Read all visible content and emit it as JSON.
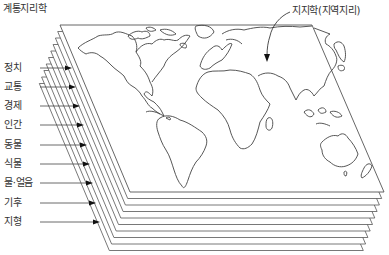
{
  "diagram": {
    "title": "계통지리학",
    "top_label": "지지학(지역지리)",
    "colors": {
      "line": "#555555",
      "text": "#333333",
      "arrow": "#111111",
      "sheet_fill": "#ffffff"
    },
    "layers": [
      {
        "label": "정치",
        "y": 68,
        "arrow_end_x": 72
      },
      {
        "label": "교통",
        "y": 87,
        "arrow_end_x": 76
      },
      {
        "label": "경제",
        "y": 106,
        "arrow_end_x": 80
      },
      {
        "label": "인간",
        "y": 125,
        "arrow_end_x": 84
      },
      {
        "label": "동물",
        "y": 145,
        "arrow_end_x": 87
      },
      {
        "label": "식물",
        "y": 164,
        "arrow_end_x": 90
      },
      {
        "label": "물·얼음",
        "y": 183,
        "arrow_end_x": 93
      },
      {
        "label": "기후",
        "y": 203,
        "arrow_end_x": 96
      },
      {
        "label": "지형",
        "y": 222,
        "arrow_end_x": 100
      }
    ],
    "sheet_count": 10,
    "top_sheet": {
      "tl": [
        60,
        25
      ],
      "tr": [
        312,
        25
      ],
      "br": [
        384,
        192
      ],
      "bl": [
        130,
        192
      ]
    },
    "sheet_offset": {
      "dx": -2.3,
      "dy": 6.5
    }
  }
}
